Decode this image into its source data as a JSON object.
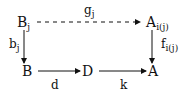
{
  "diagram": {
    "type": "commutative-diagram",
    "nodes": {
      "Bj": {
        "base": "B",
        "sub": "j"
      },
      "Aij": {
        "base": "A",
        "sub": "i(j)"
      },
      "B": {
        "base": "B"
      },
      "D": {
        "base": "D"
      },
      "A": {
        "base": "A"
      }
    },
    "arrows": {
      "g": {
        "from": "Bj",
        "to": "Aij",
        "style": "dashed",
        "label_base": "g",
        "label_sub": "j"
      },
      "b": {
        "from": "Bj",
        "to": "B",
        "style": "solid",
        "label_base": "b",
        "label_sub": "j"
      },
      "f": {
        "from": "Aij",
        "to": "A",
        "style": "solid",
        "label_base": "f",
        "label_sub": "i(j)"
      },
      "d": {
        "from": "B",
        "to": "D",
        "style": "solid",
        "label_base": "d"
      },
      "k": {
        "from": "D",
        "to": "A",
        "style": "solid",
        "label_base": "k"
      }
    }
  }
}
